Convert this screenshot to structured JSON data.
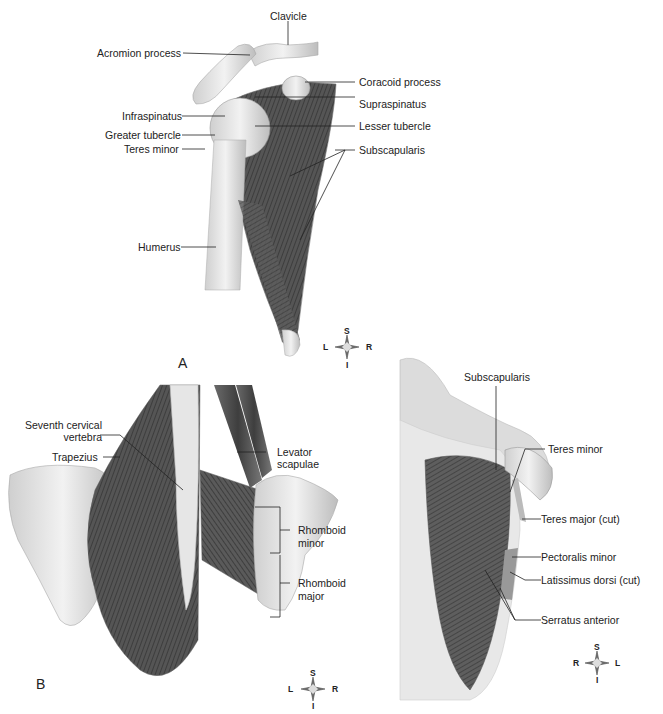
{
  "figure": {
    "panels": [
      {
        "id": "A",
        "letter": "A",
        "view": "anterior shoulder",
        "labels": {
          "clavicle": "Clavicle",
          "acromion": "Acromion process",
          "coracoid": "Coracoid process",
          "supraspinatus": "Supraspinatus",
          "infraspinatus": "Infraspinatus",
          "lesser_tubercle": "Lesser tubercle",
          "greater_tubercle": "Greater tubercle",
          "teres_minor": "Teres minor",
          "subscapularis": "Subscapularis",
          "humerus": "Humerus"
        },
        "compass": {
          "top": "S",
          "bottom": "I",
          "left": "L",
          "right": "R"
        }
      },
      {
        "id": "B",
        "letter": "B",
        "view": "posterior upper back",
        "labels": {
          "seventh_cervical_1": "Seventh cervical",
          "seventh_cervical_2": "vertebra",
          "trapezius": "Trapezius",
          "levator_1": "Levator",
          "levator_2": "scapulae",
          "rhomboid_minor_1": "Rhomboid",
          "rhomboid_minor_2": "minor",
          "rhomboid_major_1": "Rhomboid",
          "rhomboid_major_2": "major"
        },
        "compass": {
          "top": "S",
          "bottom": "I",
          "left": "L",
          "right": "R"
        }
      },
      {
        "id": "C",
        "view": "lateral thorax",
        "labels": {
          "subscapularis": "Subscapularis",
          "teres_minor": "Teres minor",
          "teres_major": "Teres major (cut)",
          "pectoralis_minor": "Pectoralis minor",
          "latissimus": "Latissimus dorsi (cut)",
          "serratus": "Serratus anterior"
        },
        "compass": {
          "top": "S",
          "bottom": "I",
          "left": "R",
          "right": "L"
        }
      }
    ]
  }
}
